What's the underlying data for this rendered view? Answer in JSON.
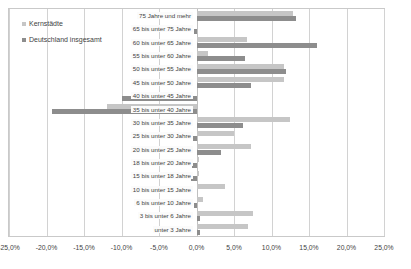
{
  "legend": {
    "position": "top-left",
    "items": [
      {
        "label": "Kernstädte",
        "color": "#c6c6c6"
      },
      {
        "label": "Deutschland insgesamt",
        "color": "#8d8d8d"
      }
    ]
  },
  "axis": {
    "ticks": [
      "-25,0%",
      "-20,0%",
      "-15,0%",
      "-10,0%",
      "-5,0%",
      "0,0%",
      "5,0%",
      "10,0%",
      "15,0%",
      "20,0%",
      "25,0%"
    ],
    "min": -25.0,
    "max": 25.0,
    "step": 5.0
  },
  "chart_data": {
    "type": "bar",
    "orientation": "horizontal",
    "title": "",
    "xlabel": "",
    "ylabel": "",
    "xlim": [
      -25.0,
      25.0
    ],
    "grid": true,
    "legend_position": "top-left",
    "categories": [
      "75 Jahre und mehr",
      "65 bis unter 75 Jahre",
      "60 bis unter 65 Jahre",
      "55 bis unter 60 Jahre",
      "50 bis unter 55 Jahre",
      "45 bis unter 50 Jahre",
      "40 bis unter 45 Jahre",
      "35 bis unter 40 Jahre",
      "30 bis unter 35 Jahre",
      "25 bis unter 30 Jahre",
      "20 bis unter 25 Jahre",
      "18 bis unter 20 Jahre",
      "15 bis unter 18 Jahre",
      "10 bis unter 15 Jahre",
      "6 bis unter 10 Jahre",
      "3 bis unter 6 Jahre",
      "unter 3 Jahre"
    ],
    "series": [
      {
        "name": "Kernstädte",
        "color": "#c6c6c6",
        "values": [
          12.8,
          0.0,
          6.7,
          1.5,
          11.6,
          11.7,
          0.0,
          -12.0,
          12.5,
          5.0,
          7.2,
          0.3,
          0.3,
          3.8,
          0.8,
          7.5,
          6.8
        ]
      },
      {
        "name": "Deutschland insgesamt",
        "color": "#8d8d8d",
        "values": [
          13.3,
          -0.4,
          16.1,
          6.4,
          11.9,
          7.3,
          -10.0,
          -19.3,
          6.2,
          -0.5,
          3.3,
          -0.6,
          -0.8,
          0.0,
          -0.3,
          0.4,
          0.5
        ]
      }
    ]
  }
}
